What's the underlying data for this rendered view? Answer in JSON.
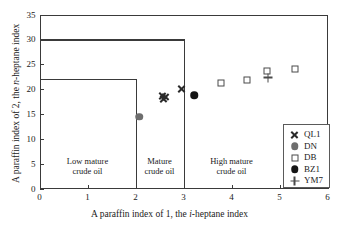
{
  "chart_data": {
    "type": "scatter",
    "title": "",
    "xlabel": "A paraffin index of 1, the i-heptane index",
    "ylabel": "A paraffin index of 2, the n-heptane index",
    "xlim": [
      0,
      6
    ],
    "ylim": [
      0,
      35
    ],
    "xticks": [
      "0",
      "1",
      "2",
      "3",
      "4",
      "5",
      "6"
    ],
    "yticks": [
      "0",
      "5",
      "10",
      "15",
      "20",
      "25",
      "30",
      "35"
    ],
    "grid": false,
    "legend_position": "bottom-right",
    "series": [
      {
        "name": "QL1",
        "marker": "cross",
        "color": "#2b2b2b",
        "points": [
          {
            "x": 2.55,
            "y": 18.6
          },
          {
            "x": 2.58,
            "y": 18.0
          },
          {
            "x": 2.62,
            "y": 18.4
          },
          {
            "x": 2.95,
            "y": 20.1
          }
        ]
      },
      {
        "name": "DN",
        "marker": "filled-gray-circle",
        "color": "#6e6e6e",
        "points": [
          {
            "x": 2.08,
            "y": 14.4
          }
        ]
      },
      {
        "name": "DB",
        "marker": "open-square",
        "color": "#4a4a4a",
        "points": [
          {
            "x": 3.78,
            "y": 21.2
          },
          {
            "x": 4.32,
            "y": 21.8
          },
          {
            "x": 4.74,
            "y": 23.6
          },
          {
            "x": 5.33,
            "y": 24.1
          }
        ]
      },
      {
        "name": "BZ1",
        "marker": "filled-black-circle",
        "color": "#151515",
        "points": [
          {
            "x": 3.22,
            "y": 18.8
          }
        ]
      },
      {
        "name": "YM7",
        "marker": "plus",
        "color": "#4a4a4a",
        "points": [
          {
            "x": 4.76,
            "y": 22.3
          }
        ]
      }
    ],
    "regions": [
      {
        "label_line1": "Low mature",
        "label_line2": "crude oil",
        "x_center": 1.0,
        "x_start": 0,
        "x_end": 2,
        "boundary_y": 22
      },
      {
        "label_line1": "Mature",
        "label_line2": "crude oil",
        "x_center": 2.5,
        "x_start": 2,
        "x_end": 3,
        "boundary_y": 30
      },
      {
        "label_line1": "High mature",
        "label_line2": "crude oil",
        "x_center": 4.0,
        "x_start": 3,
        "x_end": 6,
        "boundary_y": 35
      }
    ],
    "boundary_lines": [
      {
        "type": "horizontal",
        "y": 22,
        "x_from": 0,
        "x_to": 2
      },
      {
        "type": "vertical",
        "x": 2,
        "y_from": 0,
        "y_to": 22
      },
      {
        "type": "horizontal",
        "y": 30,
        "x_from": 0,
        "x_to": 3
      },
      {
        "type": "vertical",
        "x": 3,
        "y_from": 0,
        "y_to": 30
      }
    ]
  },
  "legend": {
    "entries": [
      {
        "label": "QL1",
        "marker": "cross"
      },
      {
        "label": "DN",
        "marker": "filled-gray-circle"
      },
      {
        "label": "DB",
        "marker": "open-square"
      },
      {
        "label": "BZ1",
        "marker": "filled-black-circle"
      },
      {
        "label": "YM7",
        "marker": "plus"
      }
    ]
  },
  "axis_title_x": {
    "part1": "A paraffin index of 1, the ",
    "italic": "i",
    "part2": "-heptane index"
  },
  "axis_title_y": {
    "part1": "A paraffin index of 2, the ",
    "italic": "n",
    "part2": "-heptane index"
  }
}
